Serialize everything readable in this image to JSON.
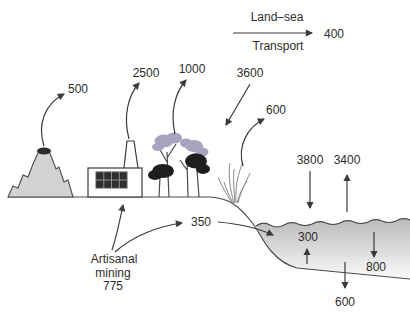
{
  "legend": {
    "title_line1": "Land–sea",
    "title_line2": "Transport",
    "value": "400"
  },
  "emissions": {
    "volcano": "500",
    "industry": "2500",
    "vegetation": "1000",
    "atmospheric_deposition_land": "3600",
    "coastal_vegetation": "600"
  },
  "ocean": {
    "atmospheric_deposition_sea": "3800",
    "sea_evasion": "3400",
    "river_transport": "350",
    "sediment_release": "300",
    "particle_settling": "800",
    "sediment_burial": "600"
  },
  "source": {
    "label_line1": "Artisanal",
    "label_line2": "mining",
    "value": "775"
  },
  "colors": {
    "sea_top": "#bcbcbc",
    "sea_bottom": "#fbfbfb",
    "mountain_fill": "#d2d2d2",
    "crater_fill": "#2b2b2b",
    "foliage_light": "#aaa3c0",
    "foliage_dark": "#1f1f1f",
    "window_fill": "#2f2f2f"
  }
}
